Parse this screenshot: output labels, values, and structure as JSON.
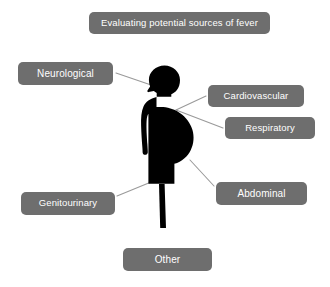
{
  "canvas": {
    "width": 330,
    "height": 287,
    "background_color": "#ffffff"
  },
  "style": {
    "box_fill": "#6e6e6e",
    "box_text_color": "#ffffff",
    "connector_color": "#9a9a9a",
    "figure_color": "#000000"
  },
  "title": {
    "label": "Evaluating potential sources of fever"
  },
  "figure": {
    "name": "pregnant-woman-silhouette"
  },
  "nodes": [
    {
      "id": "neurological",
      "label": "Neurological"
    },
    {
      "id": "cardiovascular",
      "label": "Cardiovascular"
    },
    {
      "id": "respiratory",
      "label": "Respiratory"
    },
    {
      "id": "abdominal",
      "label": "Abdominal"
    },
    {
      "id": "genitourinary",
      "label": "Genitourinary"
    },
    {
      "id": "other",
      "label": "Other"
    }
  ],
  "connectors": [
    {
      "from": "neurological",
      "to": "head"
    },
    {
      "from": "cardiovascular",
      "to": "chest"
    },
    {
      "from": "respiratory",
      "to": "chest"
    },
    {
      "from": "abdominal",
      "to": "abdomen"
    },
    {
      "from": "genitourinary",
      "to": "pelvis"
    }
  ]
}
